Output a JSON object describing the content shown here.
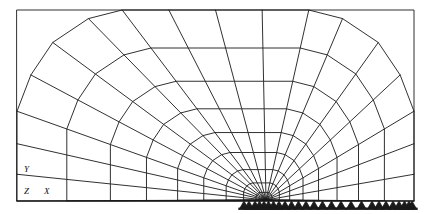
{
  "figure": {
    "name": "tunnel-fem-mesh-perspective",
    "background_color": "#ffffff",
    "line_color": "#1a1a1a",
    "line_width": 0.9,
    "width": 430,
    "height": 214
  },
  "axis_triad": {
    "y_label": "Y",
    "z_label": "Z",
    "x_label": "X",
    "y_pos": {
      "x": 24,
      "y": 172
    },
    "z_pos": {
      "x": 24,
      "y": 194
    },
    "x_pos": {
      "x": 44,
      "y": 194
    }
  },
  "frame": {
    "left": 17,
    "top": 10,
    "right": 414,
    "bottom": 201
  },
  "vanishing_point": {
    "x": 266,
    "y": 200
  },
  "supports": {
    "symbol": "roller-triangle",
    "count": 26,
    "baseline_y": 201,
    "triangle_height": 7,
    "triangle_half_width": 4,
    "x_positions": [
      255,
      259.5,
      264,
      268.5,
      273.5,
      279,
      285,
      291.5,
      298.5,
      306,
      314,
      322.5,
      331.5,
      341,
      351,
      361.5,
      372,
      379,
      386,
      393,
      399,
      404.5,
      409,
      412,
      249,
      244
    ]
  },
  "cross_sections": [
    {
      "name": "outer-portal",
      "scale": 1.0,
      "depth": 0.0
    },
    {
      "name": "bay-1",
      "scale": 0.8,
      "depth": 0.2
    },
    {
      "name": "bay-2",
      "scale": 0.625,
      "depth": 0.375
    },
    {
      "name": "bay-3",
      "scale": 0.48,
      "depth": 0.52
    },
    {
      "name": "bay-4",
      "scale": 0.355,
      "depth": 0.645
    },
    {
      "name": "bay-5",
      "scale": 0.25,
      "depth": 0.75
    },
    {
      "name": "bay-6",
      "scale": 0.16,
      "depth": 0.84
    },
    {
      "name": "bay-7",
      "scale": 0.09,
      "depth": 0.91
    },
    {
      "name": "bay-8",
      "scale": 0.04,
      "depth": 0.96
    }
  ],
  "section_profile": {
    "description": "Half-profile node ring of the tunnel cross-section (right half, mirrored for left). Units are fractions of the portal half-width / height measured from the vanishing point.",
    "nodes": [
      {
        "id": "crown-center",
        "u": 0.0,
        "v": -1.0
      },
      {
        "id": "crown-1",
        "u": 0.235,
        "v": -1.0
      },
      {
        "id": "crown-2",
        "u": 0.47,
        "v": -1.0
      },
      {
        "id": "crown-3",
        "u": 0.64,
        "v": -0.955
      },
      {
        "id": "haunch-1",
        "u": 0.82,
        "v": -0.83
      },
      {
        "id": "haunch-2",
        "u": 0.93,
        "v": -0.66
      },
      {
        "id": "springline",
        "u": 1.0,
        "v": -0.47
      },
      {
        "id": "wall-1",
        "u": 1.0,
        "v": -0.3
      },
      {
        "id": "wall-2",
        "u": 1.0,
        "v": -0.14
      },
      {
        "id": "invert-corner",
        "u": 1.0,
        "v": 0.0
      }
    ],
    "radial_lines": 13,
    "ring_lines": 9
  },
  "chart_data": {
    "type": "diagram",
    "title": "",
    "xlabel": "X",
    "ylabel": "Y",
    "zlabel": "Z"
  }
}
